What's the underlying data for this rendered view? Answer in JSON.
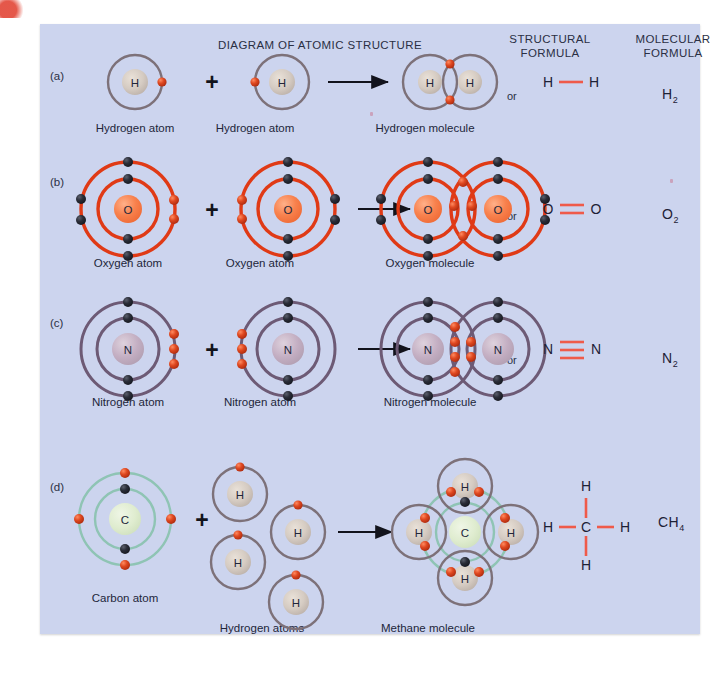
{
  "figure": {
    "headers": {
      "diagram": "DIAGRAM OF ATOMIC STRUCTURE",
      "structural_line1": "STRUCTURAL",
      "structural_line2": "FORMULA",
      "molecular_line1": "MOLECULAR",
      "molecular_line2": "FORMULA"
    },
    "or_label": "or",
    "plus_label": "+",
    "colors": {
      "background": "#ccd4ee",
      "page": "#ffffff",
      "hydrogen_shell": "#7d7179",
      "oxygen_shell": "#e03a16",
      "nitrogen_shell": "#6d5a75",
      "carbon_shell": "#8fc4b4",
      "electron_outer": "#d63a18",
      "electron_inner": "#20222b",
      "bond": "#ef5a4a",
      "text": "#22263a",
      "arrow": "#12131c"
    },
    "rows": [
      {
        "id": "a",
        "label": "(a)",
        "element": "H",
        "element_name": "Hydrogen",
        "atom_caption": "Hydrogen atom",
        "molecule_caption": "Hydrogen molecule",
        "structural_formula": "H — H",
        "structural_atoms": [
          "H",
          "H"
        ],
        "bond_order": 1,
        "molecular_formula": "H2",
        "molecular_symbol": "H",
        "molecular_subscript": "2",
        "shells": 1,
        "shared_electrons": 2,
        "shell_color": "#7d7179"
      },
      {
        "id": "b",
        "label": "(b)",
        "element": "O",
        "element_name": "Oxygen",
        "atom_caption": "Oxygen atom",
        "molecule_caption": "Oxygen molecule",
        "structural_formula": "O = O",
        "structural_atoms": [
          "O",
          "O"
        ],
        "bond_order": 2,
        "molecular_formula": "O2",
        "molecular_symbol": "O",
        "molecular_subscript": "2",
        "shells": 2,
        "shared_electrons": 4,
        "shell_color": "#e03a16"
      },
      {
        "id": "c",
        "label": "(c)",
        "element": "N",
        "element_name": "Nitrogen",
        "atom_caption": "Nitrogen atom",
        "molecule_caption": "Nitrogen molecule",
        "structural_formula": "N ≡ N",
        "structural_atoms": [
          "N",
          "N"
        ],
        "bond_order": 3,
        "molecular_formula": "N2",
        "molecular_symbol": "N",
        "molecular_subscript": "2",
        "shells": 2,
        "shared_electrons": 6,
        "shell_color": "#6d5a75"
      },
      {
        "id": "d",
        "label": "(d)",
        "element": "C",
        "element_name": "Carbon",
        "atom_caption": "Carbon atom",
        "partner_caption": "Hydrogen atoms",
        "molecule_caption": "Methane molecule",
        "structural_center": "C",
        "structural_outer": [
          "H",
          "H",
          "H",
          "H"
        ],
        "bond_order": 1,
        "molecular_formula": "CH4",
        "molecular_symbol": "CH",
        "molecular_subscript": "4",
        "shells": 2,
        "shared_electrons": 8,
        "shell_color": "#8fc4b4"
      }
    ]
  }
}
